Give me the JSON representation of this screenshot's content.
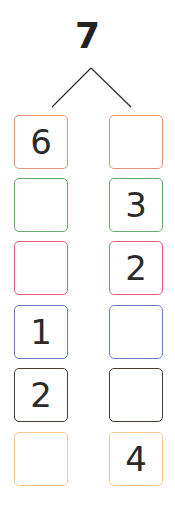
{
  "diagram": {
    "type": "number-bond",
    "whole": "7",
    "columns": 2,
    "rows": [
      {
        "color": "#d9967a",
        "left": "6",
        "right": ""
      },
      {
        "color": "#6aa86e",
        "left": "",
        "right": "3"
      },
      {
        "color": "#e0607a",
        "left": "",
        "right": "2"
      },
      {
        "color": "#6a80b8",
        "left": "1",
        "right": ""
      },
      {
        "color": "#4a3c36",
        "left": "2",
        "right": ""
      },
      {
        "color": "#f2c990",
        "left": "",
        "right": "4"
      }
    ]
  }
}
